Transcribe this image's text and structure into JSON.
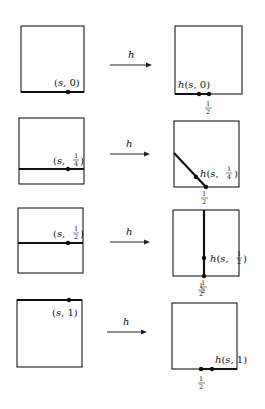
{
  "figure": {
    "map_label": "h",
    "rows": [
      {
        "domain_label_prefix": "(s, ",
        "domain_label_value": "0",
        "domain_label_suffix": ")",
        "image_label_prefix": "h(s, ",
        "image_label_value": "0",
        "image_label_suffix": ")",
        "tick_labels": [
          {
            "num": "1",
            "den": "2"
          }
        ]
      },
      {
        "domain_label_prefix": "(s, ",
        "domain_label_num": "1",
        "domain_label_den": "4",
        "domain_label_suffix": ")",
        "image_label_prefix": "h(s, ",
        "image_label_num": "1",
        "image_label_den": "4",
        "image_label_suffix": ")",
        "tick_labels": [
          {
            "num": "1",
            "den": "2"
          }
        ]
      },
      {
        "domain_label_prefix": "(s, ",
        "domain_label_num": "1",
        "domain_label_den": "2",
        "domain_label_suffix": ")",
        "image_label_prefix": "h(s, ",
        "image_label_num": "1",
        "image_label_den": "2",
        "image_label_suffix": ")",
        "tick_labels": [
          {
            "num": "1",
            "den": "2"
          },
          {
            "num": "1",
            "den": "2"
          }
        ]
      },
      {
        "domain_label_prefix": "(s, ",
        "domain_label_value": "1",
        "domain_label_suffix": ")",
        "image_label_prefix": "h(s, ",
        "image_label_value": "1",
        "image_label_suffix": ")",
        "tick_labels": [
          {
            "num": "1",
            "den": "2"
          },
          {
            "num": "1",
            "den": "2"
          }
        ]
      }
    ]
  },
  "colors": {
    "line": "#111111",
    "background": "#ffffff"
  }
}
